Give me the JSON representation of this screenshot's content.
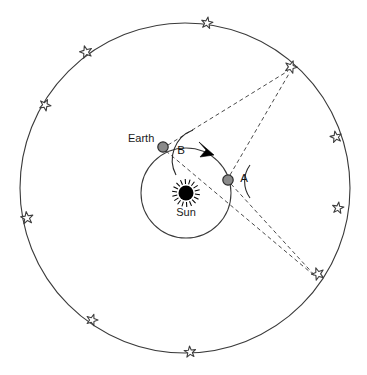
{
  "diagram": {
    "type": "astronomy-diagram",
    "canvas": {
      "width": 367,
      "height": 375
    },
    "background_color": "#ffffff",
    "stroke_color": "#3a3a3a"
  },
  "labels": {
    "earth": "Earth",
    "sun": "Sun",
    "angle_b": "B",
    "angle_a": "A"
  },
  "bodies": {
    "sun": {
      "name": "Sun",
      "cx": 186,
      "cy": 193,
      "core_radius": 7.5,
      "ray_count": 18,
      "ray_inner": 9,
      "ray_outer": 14,
      "color": "#000000",
      "label_x": 179,
      "label_y": 214
    },
    "earth_position_b": {
      "name": "Earth",
      "cx": 163,
      "cy": 147,
      "radius": 5.2,
      "fill": "#8a8a8a",
      "stroke": "#2b2b2b",
      "label_x": 128,
      "label_y": 142,
      "angle_label_x": 181,
      "angle_label_y": 153
    },
    "earth_position_a": {
      "name": "A",
      "cx": 228,
      "cy": 180,
      "radius": 5.2,
      "fill": "#8a8a8a",
      "stroke": "#2b2b2b",
      "angle_label_x": 243,
      "angle_label_y": 180
    }
  },
  "orbit": {
    "name": "earth-orbit",
    "cx": 186,
    "cy": 193,
    "radius": 45,
    "direction": "counterclockwise",
    "arrow": {
      "tip_x": 198,
      "tip_y": 144,
      "points": "198,143 213,154 200,157 205,151"
    }
  },
  "celestial_sphere": {
    "name": "celestial-sphere",
    "cx": 185,
    "cy": 188,
    "radius": 165
  },
  "stars": [
    {
      "id": "star-1",
      "cx": 207,
      "cy": 23,
      "size": 12,
      "rotation": 10
    },
    {
      "id": "star-2",
      "cx": 86,
      "cy": 52,
      "size": 13,
      "rotation": -15
    },
    {
      "id": "star-3",
      "cx": 45,
      "cy": 105,
      "size": 12,
      "rotation": 25
    },
    {
      "id": "star-4",
      "cx": 27,
      "cy": 218,
      "size": 13,
      "rotation": -8
    },
    {
      "id": "star-5",
      "cx": 92,
      "cy": 320,
      "size": 12,
      "rotation": 18
    },
    {
      "id": "star-6",
      "cx": 190,
      "cy": 352,
      "size": 12,
      "rotation": -5
    },
    {
      "id": "star-7-target",
      "cx": 291,
      "cy": 67,
      "size": 13,
      "rotation": 20
    },
    {
      "id": "star-8",
      "cx": 336,
      "cy": 137,
      "size": 12,
      "rotation": -12
    },
    {
      "id": "star-9",
      "cx": 338,
      "cy": 208,
      "size": 12,
      "rotation": 8
    },
    {
      "id": "star-10-reference",
      "cx": 318,
      "cy": 274,
      "size": 13,
      "rotation": -20
    }
  ],
  "sightlines": [
    {
      "id": "sightline-b-to-near-star",
      "from": "earth_position_b",
      "x1": 168,
      "y1": 145,
      "x2": 288,
      "y2": 71
    },
    {
      "id": "sightline-a-to-near-star",
      "from": "earth_position_a",
      "x1": 230,
      "y1": 175,
      "x2": 290,
      "y2": 72
    },
    {
      "id": "sightline-b-to-far-star",
      "from": "earth_position_b",
      "x1": 166,
      "y1": 151,
      "x2": 316,
      "y2": 277
    },
    {
      "id": "sightline-a-to-far-star",
      "from": "earth_position_a",
      "x1": 231,
      "y1": 184,
      "x2": 318,
      "y2": 279
    }
  ],
  "angle_arcs": [
    {
      "id": "angle-arc-b",
      "label": "B",
      "path": "M 193 130 A 32 32 0 0 0 176 175"
    },
    {
      "id": "angle-arc-a",
      "label": "A",
      "path": "M 250 165 A 28 28 0 0 0 250 198"
    }
  ]
}
